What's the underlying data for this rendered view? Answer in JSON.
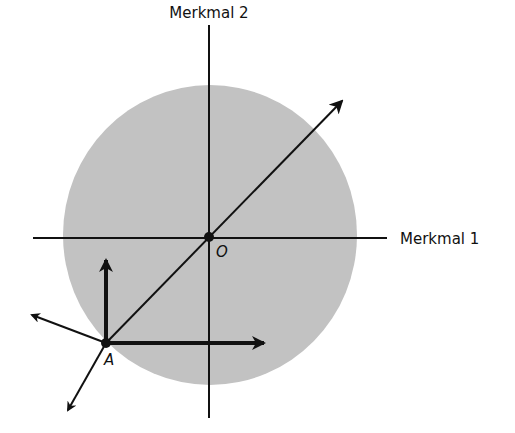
{
  "diagram": {
    "axis_labels": {
      "x": "Merkmal 1",
      "y": "Merkmal 2"
    },
    "points": {
      "origin": "O",
      "a": "A"
    },
    "colors": {
      "region_fill": "#c2c2c2",
      "stroke": "#111111",
      "background": "#ffffff"
    },
    "elements": [
      "feature-space disk (gray)",
      "horizontal axis Merkmal 1",
      "vertical axis Merkmal 2",
      "diagonal arrow through O and A",
      "thick arrows from A: up and right",
      "thin arrows from A: up-left and down-left"
    ]
  }
}
